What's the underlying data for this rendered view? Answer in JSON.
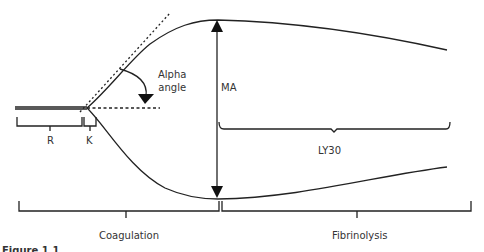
{
  "figure": {
    "type": "thromboelastography tracing",
    "labels": {
      "r": "R",
      "k": "K",
      "alpha_angle": [
        "Alpha",
        "angle"
      ],
      "ma": "MA",
      "ly30": "LY30",
      "coagulation": "Coagulation",
      "fibrinolysis": "Fibrinolysis"
    },
    "caption_fragment": "Figure 1.1",
    "colors": {
      "line": "#222222",
      "text": "#333333",
      "background": "#ffffff"
    }
  }
}
